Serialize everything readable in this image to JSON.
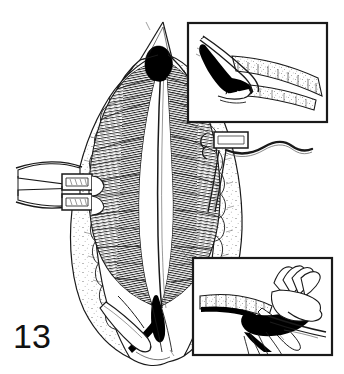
{
  "figure": {
    "number_label": "13",
    "type": "surgical line illustration",
    "caption": "",
    "background_color": "#ffffff",
    "ink_color": "#1a1a1a",
    "fill_color": "#000000",
    "width": 344,
    "height": 374
  },
  "main_illustration": {
    "name": "main-surgical-field",
    "description": "Opened midline abdominal wall with retractors exposing rectus muscle and linea alba",
    "elements": [
      {
        "name": "wound-edge-left",
        "label": "Left wound edge with subcutaneous fat"
      },
      {
        "name": "wound-edge-right",
        "label": "Right wound edge with subcutaneous fat"
      },
      {
        "name": "linea-alba-midline",
        "label": "Midline raphe"
      },
      {
        "name": "muscle-fibers-left",
        "label": "Left muscle fiber hatching"
      },
      {
        "name": "muscle-fibers-right",
        "label": "Right muscle fiber hatching"
      },
      {
        "name": "black-apex-region",
        "label": "Dark exposed apex"
      },
      {
        "name": "black-inferior-region",
        "label": "Dark inferior incision"
      },
      {
        "name": "retractor-left",
        "label": "Left self-retaining retractor"
      },
      {
        "name": "retractor-right",
        "label": "Right retractor hook"
      },
      {
        "name": "instrument-scissors",
        "label": "Dissecting instrument"
      }
    ]
  },
  "insets": [
    {
      "name": "inset-top-right",
      "label": "Sagittal cross-section detail",
      "x": 187,
      "y": 22,
      "width": 141,
      "height": 101,
      "border_color": "#1a1a1a",
      "border_width": 2
    },
    {
      "name": "inset-bottom-right",
      "label": "Hand holding instrument cross-section detail",
      "x": 192,
      "y": 257,
      "width": 141,
      "height": 99,
      "border_color": "#1a1a1a",
      "border_width": 2
    }
  ]
}
